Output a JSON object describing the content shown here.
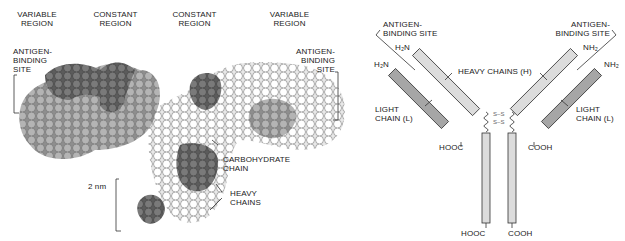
{
  "left_panel": {
    "title": "Space-filling model of antibody",
    "regions": [
      {
        "line1": "VARIABLE",
        "line2": "REGION"
      },
      {
        "line1": "CONSTANT",
        "line2": "REGION"
      },
      {
        "line1": "CONSTANT",
        "line2": "REGION"
      },
      {
        "line1": "VARIABLE",
        "line2": "REGION"
      }
    ],
    "antigen_left": {
      "line1": "ANTIGEN-",
      "line2": "BINDING",
      "line3": "SITE"
    },
    "antigen_right": {
      "line1": "ANTIGEN-",
      "line2": "BINDING",
      "line3": "SITE"
    },
    "carbohydrate": {
      "line1": "CARBOHYDRATE",
      "line2": "CHAIN"
    },
    "heavy": {
      "line1": "HEAVY",
      "line2": "CHAINS"
    },
    "scale": "2 nm"
  },
  "right_panel": {
    "title": "Schematic of antibody structure",
    "antigen_left": {
      "line1": "ANTIGEN-",
      "line2": "BINDING SITE"
    },
    "antigen_right": {
      "line1": "ANTIGEN-",
      "line2": "BINDING SITE"
    },
    "heavy_chains": "HEAVY CHAINS (H)",
    "light_left": {
      "line1": "LIGHT",
      "line2": "CHAIN (L)"
    },
    "light_right": {
      "line1": "LIGHT",
      "line2": "CHAIN (L)"
    },
    "h2n_heavy": "H₂N",
    "h2n_light": "H₂N",
    "nh2_heavy": "NH₂",
    "nh2_light": "NH₂",
    "hooc_light": "HOOC",
    "cooh_light": "COOH",
    "hooc_heavy": "HOOC",
    "cooh_heavy": "COOH",
    "disulfide": "S–S"
  },
  "colors": {
    "dark_sphere": "#6f6f6f",
    "mid_sphere": "#a9a9a9",
    "light_sphere": "#ffffff",
    "heavy_fill": "#dcdcdc",
    "light_chain_fill": "#a6a6a6"
  }
}
